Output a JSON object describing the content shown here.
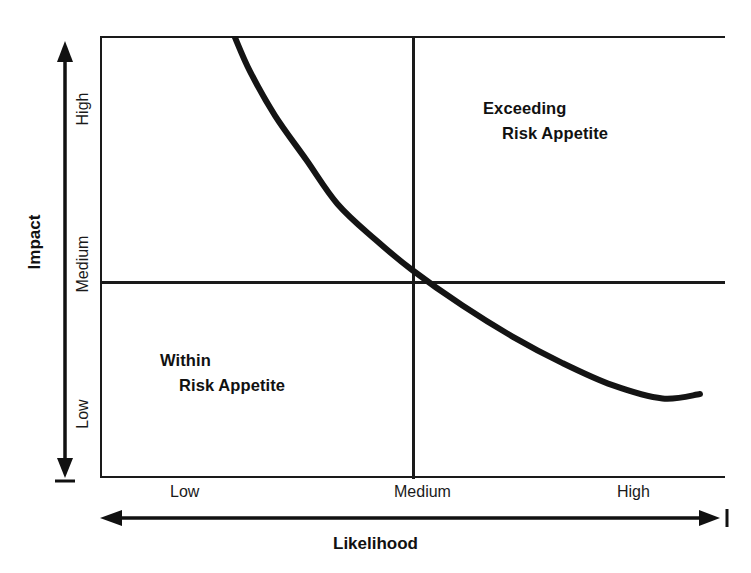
{
  "chart_data": {
    "type": "line",
    "title": "",
    "xlabel": "Likelihood",
    "ylabel": "Impact",
    "x_tick_labels": [
      "Low",
      "Medium",
      "High"
    ],
    "y_tick_labels": [
      "Low",
      "Medium",
      "High"
    ],
    "grid": false,
    "legend": "none",
    "annotations": [
      {
        "line1": "Exceeding",
        "line2": "Risk Appetite",
        "quadrant": "top-right"
      },
      {
        "line1": "Within",
        "line2": "Risk Appetite",
        "quadrant": "bottom-left"
      }
    ],
    "series": [
      {
        "name": "Risk Appetite Boundary",
        "x": [
          0.215,
          0.24,
          0.28,
          0.33,
          0.38,
          0.44,
          0.5,
          0.58,
          0.66,
          0.74,
          0.82,
          0.9,
          0.96
        ],
        "y": [
          1.0,
          0.92,
          0.82,
          0.72,
          0.62,
          0.54,
          0.47,
          0.39,
          0.32,
          0.26,
          0.21,
          0.18,
          0.19
        ]
      }
    ],
    "xlim": [
      0,
      1
    ],
    "ylim": [
      0,
      1
    ],
    "divider_x": 0.5,
    "divider_y": 0.5,
    "line_color": "#141414"
  },
  "axes": {
    "x": {
      "title": "Likelihood",
      "ticks": [
        "Low",
        "Medium",
        "High"
      ],
      "arrow": "double-headed-horizontal"
    },
    "y": {
      "title": "Impact",
      "ticks": [
        "High",
        "Medium",
        "Low"
      ],
      "arrow": "double-headed-vertical"
    }
  },
  "quadrants": {
    "exceeding": {
      "line1": "Exceeding",
      "line2": "Risk Appetite"
    },
    "within": {
      "line1": "Within",
      "line2": "Risk Appetite"
    }
  },
  "colors": {
    "line": "#141414",
    "frame": "#1a1a1a",
    "text": "#111111",
    "background": "#ffffff"
  }
}
